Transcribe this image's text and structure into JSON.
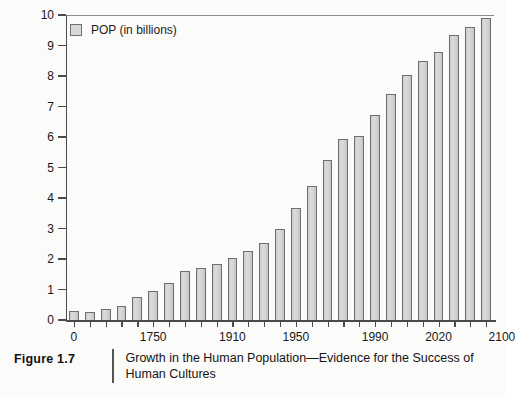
{
  "figure": {
    "number_label": "Figure 1.7",
    "caption": "Growth in the Human Population—Evidence for the Success of Human Cultures"
  },
  "legend": {
    "entries": [
      {
        "label": "POP (in billions)",
        "swatch_color": "#d8d8d8",
        "swatch_border": "#6f6f6f"
      }
    ]
  },
  "colors": {
    "bar_fill": "#d8d8d8",
    "bar_border": "#6f6f6f",
    "axis": "#4a4a4a",
    "text": "#181818",
    "background": "#fbfbfa"
  },
  "chart_data": {
    "type": "bar",
    "title": "",
    "subtitle": "",
    "xlabel": "",
    "ylabel": "",
    "ylim": [
      0,
      10
    ],
    "yticks": [
      0,
      1,
      2,
      3,
      4,
      5,
      6,
      7,
      8,
      9,
      10
    ],
    "ytick_labels": [
      "0",
      "1",
      "2",
      "3",
      "4",
      "5",
      "6",
      "7",
      "8",
      "9",
      "10"
    ],
    "grid": false,
    "legend_position": "top-left",
    "xtick_labels": [
      "0",
      "1750",
      "1910",
      "1950",
      "1990",
      "2020",
      "2100"
    ],
    "xtick_label_bar_index": [
      0,
      5,
      10,
      14,
      19,
      23,
      27
    ],
    "series": [
      {
        "name": "POP (in billions)",
        "unit": "billions",
        "values": [
          0.28,
          0.27,
          0.35,
          0.45,
          0.77,
          0.95,
          1.22,
          1.6,
          1.71,
          1.85,
          2.04,
          2.25,
          2.51,
          2.97,
          3.68,
          4.4,
          5.24,
          5.93,
          6.04,
          6.72,
          7.4,
          8.02,
          8.5,
          8.8,
          9.33,
          9.62,
          9.9
        ]
      }
    ],
    "n_bars": 27,
    "annotations": []
  }
}
